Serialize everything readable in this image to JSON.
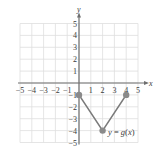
{
  "chart_data": {
    "type": "line",
    "title": "",
    "xlabel": "x",
    "ylabel": "y",
    "xlim": [
      -5,
      5
    ],
    "ylim": [
      -5,
      5
    ],
    "grid": true,
    "x_ticks": [
      "-5",
      "-4",
      "-3",
      "-2",
      "-1",
      "1",
      "2",
      "3",
      "4",
      "5"
    ],
    "y_ticks": [
      "5",
      "4",
      "3",
      "2",
      "1",
      "-1",
      "-2",
      "-3",
      "-4",
      "-5"
    ],
    "series": [
      {
        "name": "y = g(x)",
        "x": [
          0,
          2,
          4
        ],
        "y": [
          -1,
          -4,
          -1
        ],
        "endpoints": "closed",
        "color": "#7a7a7a"
      }
    ],
    "annotations": [
      {
        "text": "y = g(x)",
        "x": 3.9,
        "y": -4.3
      }
    ]
  },
  "labels": {
    "x_axis": "x",
    "y_axis": "y",
    "function": "y = g(x)",
    "x_neg": [
      "−5",
      "−4",
      "−3",
      "−2",
      "−1"
    ],
    "x_pos": [
      "1",
      "2",
      "3",
      "4",
      "5"
    ],
    "y_pos": [
      "5",
      "4",
      "3",
      "2",
      "1"
    ],
    "y_neg": [
      "−1",
      "−2",
      "−3",
      "−4",
      "−5"
    ]
  },
  "colors": {
    "grid": "#dedede",
    "axis": "#6e6e6e",
    "curve": "#7a7a7a",
    "point": "#8a8a8a",
    "text": "#3a3a3a"
  }
}
